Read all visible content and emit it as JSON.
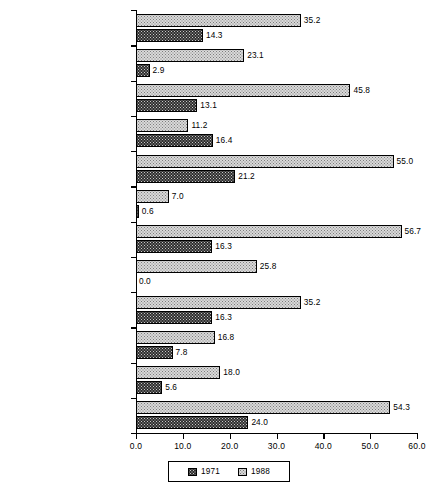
{
  "chart_data": {
    "type": "bar",
    "orientation": "horizontal",
    "title": "",
    "xlabel": "",
    "ylabel": "",
    "xlim": [
      0.0,
      60.0
    ],
    "xticks": [
      "0.0",
      "10.0",
      "20.0",
      "30.0",
      "40.0",
      "50.0",
      "60.0"
    ],
    "xtick_values": [
      0,
      10,
      20,
      30,
      40,
      50,
      60
    ],
    "grid": false,
    "legend_position": "bottom-center",
    "categories": [
      "Doctor's Degrees (Total)",
      "Business and Management",
      "Communications",
      "Computer and Information Sciences",
      "Education",
      "Engineering",
      "Health Sciences",
      "Law",
      "Life Sciences",
      "Mathematics",
      "Physical Sciences",
      "Psychology"
    ],
    "series": [
      {
        "name": "1988",
        "fill": "light-dotted",
        "values": [
          35.2,
          23.1,
          45.8,
          11.2,
          55.0,
          7.0,
          56.7,
          25.8,
          35.2,
          16.8,
          18.0,
          54.3
        ],
        "labels": [
          "35.2",
          "23.1",
          "45.8",
          "11.2",
          "55.0",
          "7.0",
          "56.7",
          "25.8",
          "35.2",
          "16.8",
          "18.0",
          "54.3"
        ]
      },
      {
        "name": "1971",
        "fill": "dark-dotted",
        "values": [
          14.3,
          2.9,
          13.1,
          16.4,
          21.2,
          0.6,
          16.3,
          0.0,
          16.3,
          7.8,
          5.6,
          24.0
        ],
        "labels": [
          "14.3",
          "2.9",
          "13.1",
          "16.4",
          "21.2",
          "0.6",
          "16.3",
          "0.0",
          "16.3",
          "7.8",
          "5.6",
          "24.0"
        ]
      }
    ]
  },
  "legend": {
    "entries": [
      {
        "label": "1971",
        "swatch": "dark-dotted-swatch"
      },
      {
        "label": "1988",
        "swatch": "light-dotted-swatch"
      }
    ]
  },
  "colors": {
    "series_1971": "#2f2f2f",
    "series_1988": "#d9d9d9",
    "axis": "#000000",
    "background": "#ffffff"
  },
  "caption": {
    "text": ""
  }
}
